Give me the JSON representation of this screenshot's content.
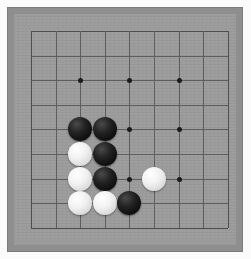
{
  "app": {
    "title": "Go Board",
    "surface_color": "#9a9a9a",
    "frame_color": "#8e8e8e",
    "line_color": "#5e5e5e",
    "black_stone_color": "#0d0d0d",
    "white_stone_color": "#f1f1f1"
  },
  "board": {
    "size": 9,
    "size_label": "9x9",
    "origin_x": 31,
    "origin_y": 31,
    "cell": 24.6,
    "star_points": [
      {
        "col": 2,
        "row": 2
      },
      {
        "col": 4,
        "row": 2
      },
      {
        "col": 6,
        "row": 2
      },
      {
        "col": 2,
        "row": 4
      },
      {
        "col": 4,
        "row": 4
      },
      {
        "col": 6,
        "row": 4
      },
      {
        "col": 2,
        "row": 6
      },
      {
        "col": 4,
        "row": 6
      },
      {
        "col": 6,
        "row": 6
      }
    ],
    "stones": [
      {
        "color": "black",
        "col": 2,
        "row": 4,
        "label": "black-stone-c3-r5"
      },
      {
        "color": "black",
        "col": 3,
        "row": 4,
        "label": "black-stone-c4-r5"
      },
      {
        "color": "white",
        "col": 2,
        "row": 5,
        "label": "white-stone-c3-r6"
      },
      {
        "color": "black",
        "col": 3,
        "row": 5,
        "label": "black-stone-c4-r6"
      },
      {
        "color": "white",
        "col": 2,
        "row": 6,
        "label": "white-stone-c3-r7"
      },
      {
        "color": "black",
        "col": 3,
        "row": 6,
        "label": "black-stone-c4-r7"
      },
      {
        "color": "white",
        "col": 5,
        "row": 6,
        "label": "white-stone-c6-r7"
      },
      {
        "color": "white",
        "col": 2,
        "row": 7,
        "label": "white-stone-c3-r8"
      },
      {
        "color": "white",
        "col": 3,
        "row": 7,
        "label": "white-stone-c4-r8"
      },
      {
        "color": "black",
        "col": 4,
        "row": 7,
        "label": "black-stone-c5-r8"
      }
    ]
  }
}
